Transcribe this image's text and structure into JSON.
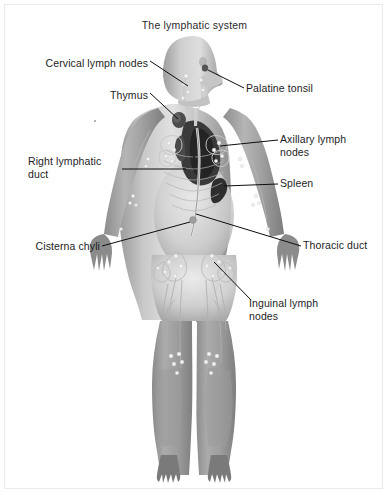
{
  "figure": {
    "title": "The lymphatic system",
    "width": 389,
    "height": 495,
    "background_color": "#ffffff",
    "border_color": "#ebebeb",
    "label_color": "#1d1d1d",
    "leader_line_color": "#000000",
    "body_fill_light": "#d9d9d9",
    "body_fill_mid": "#a8a8a8",
    "body_fill_dark": "#6e6e6e",
    "organ_dark": "#2f2f2f",
    "vessel_color": "#7d7d7d",
    "node_color": "#f2f2f2"
  },
  "labels": [
    {
      "id": "cervical-lymph-nodes",
      "text": "Cervical lymph nodes",
      "align": "right",
      "x": 30,
      "y": 57,
      "width": 118
    },
    {
      "id": "thymus",
      "text": "Thymus",
      "align": "right",
      "x": 50,
      "y": 89,
      "width": 98
    },
    {
      "id": "right-lymphatic-duct",
      "text": "Right lymphatic\nduct",
      "align": "right",
      "x": 28,
      "y": 155,
      "width": 92
    },
    {
      "id": "cisterna-chyli",
      "text": "Cisterna chyli",
      "align": "right",
      "x": 14,
      "y": 243,
      "width": 86
    },
    {
      "id": "palatine-tonsil",
      "text": "Palatine tonsil",
      "align": "left",
      "x": 246,
      "y": 82,
      "width": 110
    },
    {
      "id": "axillary-lymph-nodes",
      "text": "Axillary lymph\nnodes",
      "align": "left",
      "x": 280,
      "y": 133,
      "width": 104
    },
    {
      "id": "spleen",
      "text": "Spleen",
      "align": "left",
      "x": 280,
      "y": 177,
      "width": 80
    },
    {
      "id": "thoracic-duct",
      "text": "Thoracic duct",
      "align": "left",
      "x": 303,
      "y": 243,
      "width": 86
    },
    {
      "id": "inguinal-lymph-nodes",
      "text": "Inguinal lymph\nnodes",
      "align": "left",
      "x": 249,
      "y": 300,
      "width": 104
    }
  ]
}
